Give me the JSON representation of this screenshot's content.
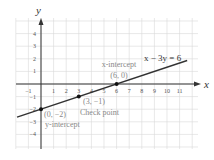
{
  "chart_data": {
    "type": "line",
    "title": "",
    "xlabel": "x",
    "ylabel": "y",
    "xlim": [
      -2,
      12
    ],
    "ylim": [
      -5,
      5
    ],
    "grid": true,
    "x_ticks": [
      -1,
      1,
      2,
      3,
      4,
      5,
      6,
      7,
      8,
      9,
      10,
      11
    ],
    "y_ticks": [
      4,
      3,
      2,
      1,
      -1,
      -2,
      -3,
      -4
    ],
    "series": [
      {
        "name": "x − 3y = 6",
        "equation": "x - 3y = 6",
        "x": [
          -2,
          12
        ],
        "y": [
          -2.667,
          2
        ]
      }
    ],
    "points": [
      {
        "x": 6,
        "y": 0,
        "label": "(6, 0)",
        "annotation": "x-intercept"
      },
      {
        "x": 3,
        "y": -1,
        "label": "(3, −1)",
        "annotation": "Check point"
      },
      {
        "x": 0,
        "y": -2,
        "label": "(0, −2)",
        "annotation": "y-intercept"
      }
    ],
    "annotations": {
      "equation_label": "x − 3y = 6",
      "x_intercept_title": "x-intercept",
      "x_intercept_coord": "(6, 0)",
      "check_coord": "(3, −1)",
      "check_title": "Check point",
      "y_intercept_coord": "(0, −2)",
      "y_intercept_title": "y-intercept"
    },
    "colors": {
      "grid": "#d8d8d8",
      "axis": "#333333",
      "line": "#333333",
      "label": "#888888"
    }
  }
}
